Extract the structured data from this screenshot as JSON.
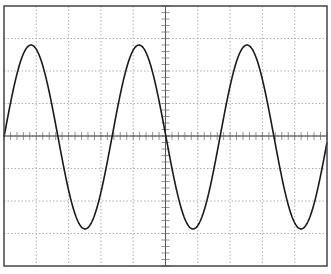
{
  "chart_data": {
    "type": "line",
    "title": "",
    "xlabel": "",
    "ylabel": "",
    "graticule": {
      "columns": 10,
      "rows": 8,
      "grid": true,
      "grid_style": "dashed",
      "center_axes_with_minor_ticks": true,
      "minor_ticks_per_division": 5
    },
    "xlim": [
      0,
      10
    ],
    "ylim": [
      -4,
      4
    ],
    "series": [
      {
        "name": "sine wave",
        "function": "y = A * sin(2*pi*x/T)",
        "amplitude_div": 2.85,
        "period_div": 3.35,
        "phase_deg": 0,
        "cycles_visible": 3,
        "peaks_x_div": [
          0.84,
          4.19,
          7.54
        ],
        "troughs_x_div": [
          2.51,
          5.86,
          9.21
        ],
        "zero_crossings_x_div": [
          0,
          1.68,
          3.35,
          5.03,
          6.7,
          8.38,
          10.05
        ]
      }
    ],
    "colors": {
      "trace": "#1a1a1a",
      "grid": "#9a9a9a",
      "frame": "#444444",
      "axis": "#333333"
    }
  },
  "geometry": {
    "frame": {
      "x": 4,
      "y": 6,
      "w": 323,
      "h": 260
    },
    "center_y": 137,
    "amplitude_px": 92,
    "period_px": 108,
    "phase_offset_px": 4
  }
}
